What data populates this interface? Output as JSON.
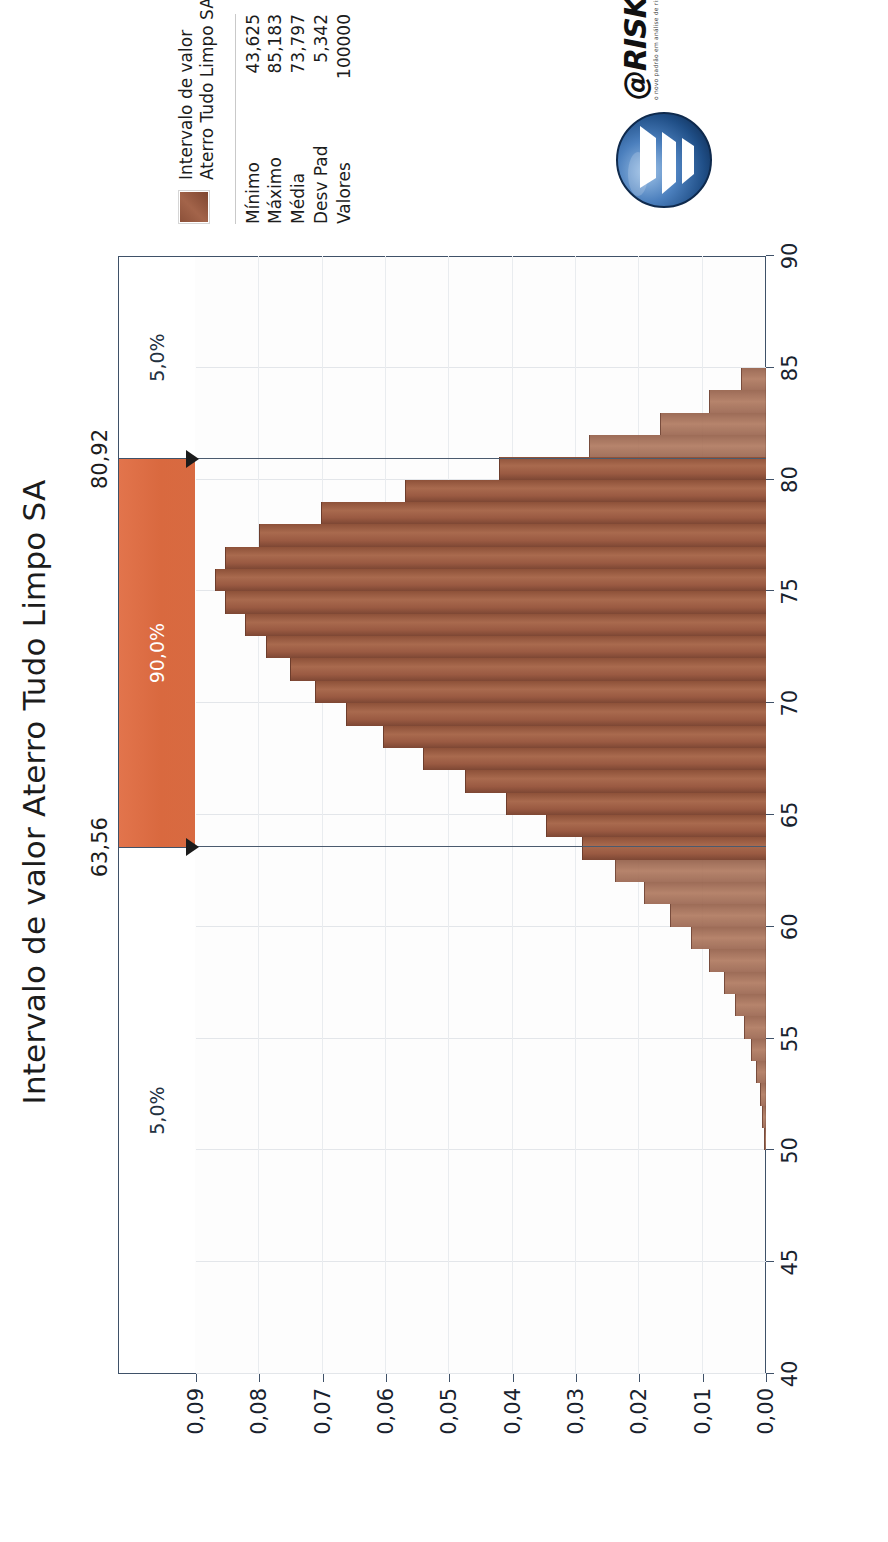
{
  "chart_data": {
    "type": "bar",
    "title": "Intervalo de valor Aterro Tudo Limpo SA",
    "subtitle": "",
    "xlabel": "",
    "ylabel": "",
    "grid": true,
    "orientation": "rotated-90",
    "xlim": [
      40,
      90
    ],
    "ylim": [
      0.0,
      0.09
    ],
    "xticks": [
      "40",
      "45",
      "50",
      "55",
      "60",
      "65",
      "70",
      "75",
      "80",
      "85",
      "90"
    ],
    "xtick_values": [
      40,
      45,
      50,
      55,
      60,
      65,
      70,
      75,
      80,
      85,
      90
    ],
    "yticks": [
      "0,00",
      "0,01",
      "0,02",
      "0,03",
      "0,04",
      "0,05",
      "0,06",
      "0,07",
      "0,08",
      "0,09"
    ],
    "ytick_values": [
      0.0,
      0.01,
      0.02,
      0.03,
      0.04,
      0.05,
      0.06,
      0.07,
      0.08,
      0.09
    ],
    "bin_width": 1.0,
    "x": [
      50.5,
      51.5,
      52.5,
      53.5,
      54.5,
      55.5,
      56.5,
      57.5,
      58.5,
      59.5,
      60.5,
      61.5,
      62.5,
      63.5,
      64.5,
      65.5,
      66.5,
      67.5,
      68.5,
      69.5,
      70.5,
      71.5,
      72.5,
      73.5,
      74.5,
      75.5,
      76.5,
      77.5,
      78.5,
      79.5,
      80.5,
      81.5,
      82.5,
      83.5,
      84.5
    ],
    "values": [
      0.0003,
      0.0006,
      0.001,
      0.0016,
      0.0024,
      0.0035,
      0.0049,
      0.0067,
      0.009,
      0.0118,
      0.0152,
      0.0192,
      0.0238,
      0.029,
      0.0348,
      0.0411,
      0.0476,
      0.0542,
      0.0605,
      0.0663,
      0.0712,
      0.0752,
      0.079,
      0.0822,
      0.0855,
      0.087,
      0.0855,
      0.08,
      0.0702,
      0.057,
      0.0422,
      0.028,
      0.0168,
      0.009,
      0.004
    ],
    "legend": {
      "position": "right",
      "swatch_color": "#8a4f38",
      "title_line1": "Intervalo de valor",
      "title_line2": "Aterro Tudo Limpo SA"
    },
    "stats": [
      {
        "label": "Mínimo",
        "value": "43,625"
      },
      {
        "label": "Máximo",
        "value": "85,183"
      },
      {
        "label": "Média",
        "value": "73,797"
      },
      {
        "label": "Desv Pad",
        "value": "5,342"
      },
      {
        "label": "Valores",
        "value": "100000"
      }
    ],
    "delimiters": {
      "left_value": 63.56,
      "right_value": 80.92,
      "left_label": "63,56",
      "right_label": "80,92",
      "bands": [
        {
          "label": "5,0%",
          "from": 40,
          "to": 63.56,
          "kind": "outer",
          "color": "#ffffff"
        },
        {
          "label": "90,0%",
          "from": 63.56,
          "to": 80.92,
          "kind": "inner",
          "color": "#dd6f46"
        },
        {
          "label": "5,0%",
          "from": 80.92,
          "to": 90,
          "kind": "outer",
          "color": "#ffffff"
        }
      ]
    },
    "colors": {
      "bar": "#9a5a42",
      "bar_tail": "#a97056",
      "band_inner": "#dd6f46",
      "axis": "#3f5168",
      "grid": "#e3e6ea",
      "text": "#1c1c1c"
    }
  },
  "branding": {
    "wordmark": "@RISK",
    "tagline": "o novo padrão em análise de risco",
    "logo_name": "at-risk-logo"
  }
}
